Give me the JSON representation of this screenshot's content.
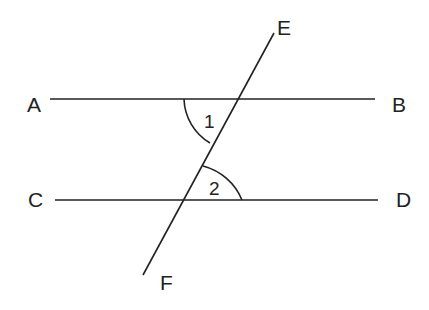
{
  "diagram": {
    "lines": [
      {
        "name": "AB",
        "x1": 50,
        "y1": 99,
        "x2": 375,
        "y2": 99
      },
      {
        "name": "CD",
        "x1": 55,
        "y1": 200,
        "x2": 378,
        "y2": 200
      },
      {
        "name": "EF",
        "x1": 274,
        "y1": 33,
        "x2": 143,
        "y2": 275
      }
    ],
    "point_labels": {
      "A": "A",
      "B": "B",
      "C": "C",
      "D": "D",
      "E": "E",
      "F": "F"
    },
    "angle_labels": {
      "angle1": "1",
      "angle2": "2"
    },
    "colors": {
      "stroke": "#222222",
      "background": "#ffffff"
    }
  }
}
